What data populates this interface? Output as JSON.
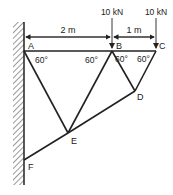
{
  "diagram": {
    "type": "truss",
    "support": "fixed-wall",
    "nodes": {
      "A": {
        "label": "A",
        "x": 24,
        "y": 51
      },
      "B": {
        "label": "B",
        "x": 112,
        "y": 51
      },
      "C": {
        "label": "C",
        "x": 156,
        "y": 51
      },
      "D": {
        "label": "D",
        "x": 135,
        "y": 91
      },
      "E": {
        "label": "E",
        "x": 68,
        "y": 133
      },
      "F": {
        "label": "F",
        "x": 24,
        "y": 160
      }
    },
    "members": [
      "A-B",
      "B-C",
      "A-E",
      "B-E",
      "B-D",
      "C-D",
      "D-E",
      "E-F"
    ],
    "dimensions": [
      {
        "label": "2 m",
        "from": "A",
        "to": "B"
      },
      {
        "label": "1 m",
        "from": "B",
        "to": "C"
      }
    ],
    "loads": [
      {
        "label": "10 kN",
        "node": "B"
      },
      {
        "label": "10 kN",
        "node": "C"
      }
    ],
    "angles": [
      {
        "label": "60°",
        "at": "A"
      },
      {
        "label": "60°",
        "at": "B-left"
      },
      {
        "label": "60°",
        "at": "B-right"
      },
      {
        "label": "60°",
        "at": "C"
      }
    ],
    "line_color": "#222222"
  }
}
